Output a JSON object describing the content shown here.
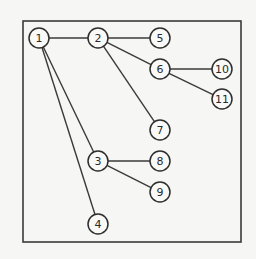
{
  "diagram": {
    "type": "tree",
    "frame": {
      "x": 23,
      "y": 21,
      "width": 218,
      "height": 221
    },
    "node_radius": 10,
    "colors": {
      "stroke": "#2e2e2e",
      "background": "#f6f6f4"
    },
    "nodes": [
      {
        "id": "1",
        "label": "1",
        "x": 39,
        "y": 38
      },
      {
        "id": "2",
        "label": "2",
        "x": 98,
        "y": 38
      },
      {
        "id": "5",
        "label": "5",
        "x": 160,
        "y": 38
      },
      {
        "id": "6",
        "label": "6",
        "x": 160,
        "y": 69
      },
      {
        "id": "10",
        "label": "10",
        "x": 222,
        "y": 69
      },
      {
        "id": "11",
        "label": "11",
        "x": 222,
        "y": 99
      },
      {
        "id": "7",
        "label": "7",
        "x": 160,
        "y": 130
      },
      {
        "id": "3",
        "label": "3",
        "x": 98,
        "y": 161
      },
      {
        "id": "8",
        "label": "8",
        "x": 160,
        "y": 161
      },
      {
        "id": "9",
        "label": "9",
        "x": 160,
        "y": 192
      },
      {
        "id": "4",
        "label": "4",
        "x": 98,
        "y": 224
      }
    ],
    "edges": [
      {
        "from": "1",
        "to": "2"
      },
      {
        "from": "1",
        "to": "3"
      },
      {
        "from": "1",
        "to": "4"
      },
      {
        "from": "2",
        "to": "5"
      },
      {
        "from": "2",
        "to": "6"
      },
      {
        "from": "2",
        "to": "7"
      },
      {
        "from": "6",
        "to": "10"
      },
      {
        "from": "6",
        "to": "11"
      },
      {
        "from": "3",
        "to": "8"
      },
      {
        "from": "3",
        "to": "9"
      }
    ]
  }
}
